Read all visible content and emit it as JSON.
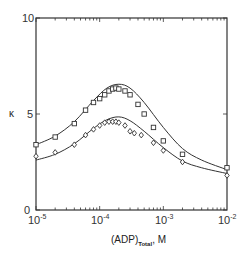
{
  "chart_data": {
    "type": "scatter",
    "title": "",
    "xlabel": "(ADP)Total, M",
    "xlabel_main": "(ADP)",
    "xlabel_sub": "Total",
    "xlabel_unit": ", M",
    "ylabel": "κ",
    "xscale": "log",
    "xlim": [
      1e-05,
      0.01
    ],
    "ylim": [
      0,
      10
    ],
    "grid": false,
    "legend": "none",
    "x_ticks": [
      {
        "base": "10",
        "exp": "-5"
      },
      {
        "base": "10",
        "exp": "-4"
      },
      {
        "base": "10",
        "exp": "-3"
      },
      {
        "base": "10",
        "exp": "-2"
      }
    ],
    "y_ticks": [
      "0",
      "5",
      "10"
    ],
    "series": [
      {
        "name": "squares",
        "marker": "square",
        "points": [
          {
            "x": 1e-05,
            "y": 3.4
          },
          {
            "x": 2e-05,
            "y": 3.8
          },
          {
            "x": 4e-05,
            "y": 4.5
          },
          {
            "x": 6e-05,
            "y": 5.2
          },
          {
            "x": 8e-05,
            "y": 5.6
          },
          {
            "x": 0.0001,
            "y": 5.8
          },
          {
            "x": 0.00012,
            "y": 6.0
          },
          {
            "x": 0.00014,
            "y": 6.2
          },
          {
            "x": 0.00016,
            "y": 6.3
          },
          {
            "x": 0.00018,
            "y": 6.35
          },
          {
            "x": 0.0002,
            "y": 6.3
          },
          {
            "x": 0.00025,
            "y": 6.2
          },
          {
            "x": 0.0003,
            "y": 6.0
          },
          {
            "x": 0.0004,
            "y": 5.5
          },
          {
            "x": 0.0005,
            "y": 5.0
          },
          {
            "x": 0.0007,
            "y": 4.3
          },
          {
            "x": 0.001,
            "y": 3.6
          },
          {
            "x": 0.002,
            "y": 2.9
          },
          {
            "x": 0.01,
            "y": 2.2
          }
        ]
      },
      {
        "name": "diamonds",
        "marker": "diamond",
        "points": [
          {
            "x": 1e-05,
            "y": 2.8
          },
          {
            "x": 2e-05,
            "y": 3.0
          },
          {
            "x": 4e-05,
            "y": 3.4
          },
          {
            "x": 6e-05,
            "y": 3.9
          },
          {
            "x": 8e-05,
            "y": 4.2
          },
          {
            "x": 0.0001,
            "y": 4.4
          },
          {
            "x": 0.00012,
            "y": 4.55
          },
          {
            "x": 0.00014,
            "y": 4.6
          },
          {
            "x": 0.00016,
            "y": 4.6
          },
          {
            "x": 0.00018,
            "y": 4.6
          },
          {
            "x": 0.0002,
            "y": 4.55
          },
          {
            "x": 0.00025,
            "y": 4.4
          },
          {
            "x": 0.0003,
            "y": 4.1
          },
          {
            "x": 0.00035,
            "y": 4.0
          },
          {
            "x": 0.00045,
            "y": 3.9
          },
          {
            "x": 0.0007,
            "y": 3.5
          },
          {
            "x": 0.001,
            "y": 3.1
          },
          {
            "x": 0.002,
            "y": 2.5
          },
          {
            "x": 0.01,
            "y": 1.8
          }
        ]
      }
    ],
    "fit_curves": [
      {
        "name": "upper-fit",
        "points": [
          {
            "x": 1e-05,
            "y": 3.4
          },
          {
            "x": 2e-05,
            "y": 3.85
          },
          {
            "x": 4e-05,
            "y": 4.6
          },
          {
            "x": 8e-05,
            "y": 5.7
          },
          {
            "x": 0.00013,
            "y": 6.35
          },
          {
            "x": 0.0002,
            "y": 6.55
          },
          {
            "x": 0.0003,
            "y": 6.35
          },
          {
            "x": 0.0005,
            "y": 5.6
          },
          {
            "x": 0.001,
            "y": 4.3
          },
          {
            "x": 0.002,
            "y": 3.2
          },
          {
            "x": 0.004,
            "y": 2.6
          },
          {
            "x": 0.01,
            "y": 2.1
          }
        ]
      },
      {
        "name": "lower-fit",
        "points": [
          {
            "x": 1e-05,
            "y": 2.6
          },
          {
            "x": 2e-05,
            "y": 2.9
          },
          {
            "x": 4e-05,
            "y": 3.45
          },
          {
            "x": 8e-05,
            "y": 4.25
          },
          {
            "x": 0.00013,
            "y": 4.7
          },
          {
            "x": 0.0002,
            "y": 4.85
          },
          {
            "x": 0.0003,
            "y": 4.65
          },
          {
            "x": 0.0005,
            "y": 4.1
          },
          {
            "x": 0.001,
            "y": 3.25
          },
          {
            "x": 0.002,
            "y": 2.55
          },
          {
            "x": 0.004,
            "y": 2.2
          },
          {
            "x": 0.01,
            "y": 1.9
          }
        ]
      }
    ]
  },
  "colors": {
    "ink": "#333333",
    "background": "#ffffff"
  }
}
